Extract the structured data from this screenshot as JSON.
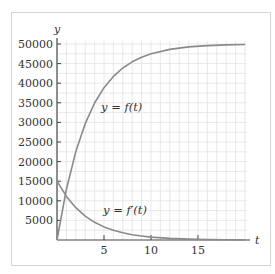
{
  "chart_data": {
    "type": "line",
    "title": "",
    "xlabel": "t",
    "ylabel": "y",
    "xlim": [
      0,
      20.5
    ],
    "ylim": [
      0,
      50800
    ],
    "grid": true,
    "x_ticks": [
      5,
      10,
      15
    ],
    "x_tick_labels": [
      "5",
      "10",
      "15"
    ],
    "y_ticks": [
      5000,
      10000,
      15000,
      20000,
      25000,
      30000,
      35000,
      40000,
      45000,
      50000
    ],
    "y_tick_labels": [
      "5000",
      "10000",
      "15000",
      "20000",
      "25000",
      "30000",
      "35000",
      "40000",
      "45000",
      "50000"
    ],
    "series": [
      {
        "name": "y = f(t)",
        "x": [
          0,
          1,
          2,
          3,
          4,
          5,
          6,
          7,
          8,
          9,
          10,
          12,
          14,
          16,
          18,
          20
        ],
        "values": [
          0,
          12959,
          22559,
          29672,
          34940,
          38843,
          41735,
          43877,
          45464,
          46640,
          47511,
          48634,
          49250,
          49588,
          49774,
          49876
        ]
      },
      {
        "name": "y = f'(t)",
        "x": [
          0,
          1,
          2,
          3,
          4,
          5,
          6,
          7,
          8,
          9,
          10,
          12,
          14,
          16,
          18,
          20
        ],
        "values": [
          15000,
          11112,
          8232,
          6099,
          4518,
          3347,
          2479,
          1837,
          1361,
          1008,
          747,
          410,
          225,
          123,
          68,
          37
        ]
      }
    ],
    "annotations": [
      {
        "text": "y = f(t)",
        "x": 4.7,
        "y": 33000
      },
      {
        "text": "y = f′(t)",
        "x": 4.9,
        "y": 7500
      }
    ],
    "legend": "none (inline curve labels)"
  },
  "labels": {
    "x_axis": "t",
    "y_axis": "y",
    "f_label": "y = f(t)",
    "fprime_label": "y = f′(t)"
  },
  "colors": {
    "curve": "#8a8a8a",
    "axis": "#444444",
    "grid": "#e2e2e2",
    "frame": "#d4d4d4"
  }
}
